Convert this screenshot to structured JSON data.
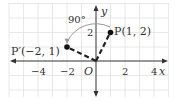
{
  "diagram": {
    "type": "coordinate-plane-rotation",
    "axes": {
      "x_label": "x",
      "y_label": "y",
      "origin_label": "O",
      "x_ticks": [
        {
          "value": -4,
          "label": "−4"
        },
        {
          "value": -2,
          "label": "−2"
        },
        {
          "value": 2,
          "label": "2"
        },
        {
          "value": 4,
          "label": "4"
        }
      ],
      "y_ticks": [
        {
          "value": 2,
          "label": "2"
        }
      ]
    },
    "points": [
      {
        "name": "P",
        "label": "P(1, 2)",
        "x": 1,
        "y": 2
      },
      {
        "name": "P'",
        "label": "P′(−2, 1)",
        "x": -2,
        "y": 1
      }
    ],
    "rotation": {
      "angle_label": "90°",
      "direction": "counterclockwise",
      "center": "O"
    },
    "colors": {
      "grid": "#e2e2e2",
      "axis": "#333333",
      "segment": "#222222",
      "arc": "#999999"
    }
  }
}
